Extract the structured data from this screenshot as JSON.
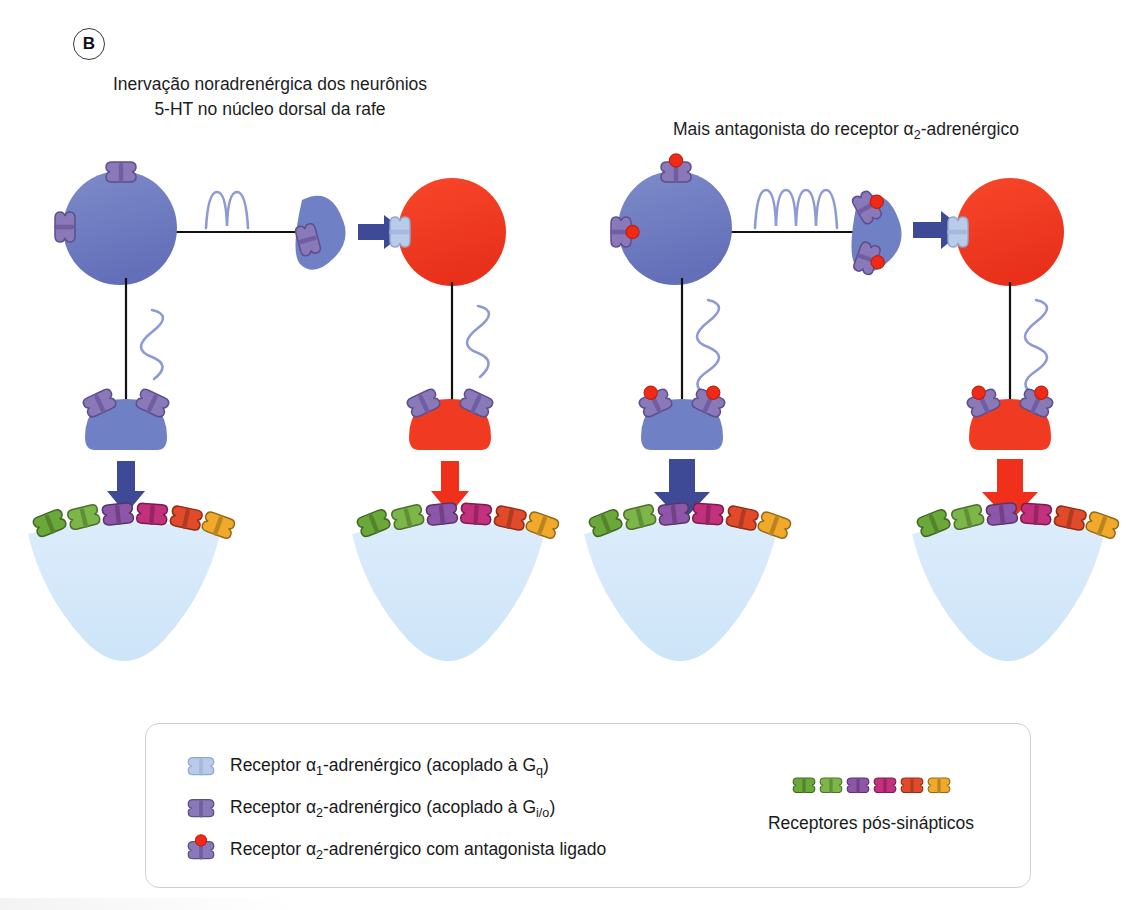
{
  "figure": {
    "panel_label": "B",
    "titles": {
      "left": "Inervação noradrenérgica dos neurônios\n5-HT no núcleo dorsal da rafe",
      "right_pre": "Mais antagonista do receptor ",
      "right_alpha": "α",
      "right_sub": "2",
      "right_post": "-adrenérgico"
    }
  },
  "legend": {
    "items": [
      {
        "icon": "alpha1-receptor-icon",
        "pre": "Receptor ",
        "alpha": "α",
        "sub": "1",
        "post": "-adrenérgico (acoplado à G",
        "gsub": "q",
        "tail": ")"
      },
      {
        "icon": "alpha2-receptor-icon",
        "pre": "Receptor ",
        "alpha": "α",
        "sub": "2",
        "post": "-adrenérgico (acoplado à G",
        "gsub": "i/o",
        "tail": ")"
      },
      {
        "icon": "alpha2-receptor-antagonist-icon",
        "pre": "Receptor ",
        "alpha": "α",
        "sub": "2",
        "post": "-adrenérgico com antagonista ligado",
        "gsub": "",
        "tail": ""
      }
    ],
    "postsynaptic_label": "Receptores pós-sinápticos",
    "postsynaptic_colors": [
      "#6aa83a",
      "#7cb648",
      "#8e56a8",
      "#c2307e",
      "#e24b2a",
      "#f0a92a"
    ]
  },
  "colors": {
    "neuron_blue": "#6f80c4",
    "neuron_blue_dark": "#4a559c",
    "neuron_red": "#f03b22",
    "postsynaptic_cell": "#d6e9f9",
    "arrow_blue": "#3f4a96",
    "arrow_red": "#f0301a",
    "axon_line": "#111111",
    "wave_blue": "#8d9ad4",
    "alpha1_light": "#b9cbe8",
    "alpha2_purple": "#8a79b8",
    "antagonist_red": "#ef2b18",
    "legend_border": "#d0d0d0"
  },
  "columns": [
    {
      "id": "col-1",
      "soma_color": "neuron_blue",
      "soma_receptors": [
        "alpha2",
        "alpha2"
      ],
      "axon_wave_cycles": 2,
      "terminal_receptors": [
        "alpha2"
      ],
      "transition_arrow": "blue",
      "target_soma_color": "neuron_red",
      "target_soma_receptors": [
        "alpha1"
      ],
      "bouton_color": "neuron_blue",
      "bouton_receptors": [
        "alpha2",
        "alpha2"
      ],
      "release_arrow": "blue",
      "release_arrow_size": "small"
    },
    {
      "id": "col-2",
      "bouton_color": "neuron_red",
      "bouton_receptors": [
        "alpha2",
        "alpha2"
      ],
      "release_arrow": "red",
      "release_arrow_size": "small"
    },
    {
      "id": "col-3",
      "soma_color": "neuron_blue",
      "soma_receptors": [
        "alpha2-antagonist",
        "alpha2-antagonist"
      ],
      "axon_wave_cycles": 4,
      "terminal_receptors": [
        "alpha2-antagonist",
        "alpha2-antagonist"
      ],
      "transition_arrow": "blue",
      "target_soma_color": "neuron_red",
      "target_soma_receptors": [
        "alpha1"
      ],
      "bouton_color": "neuron_blue",
      "bouton_receptors": [
        "alpha2-antagonist",
        "alpha2-antagonist"
      ],
      "release_arrow": "blue",
      "release_arrow_size": "large"
    },
    {
      "id": "col-4",
      "bouton_color": "neuron_red",
      "bouton_receptors": [
        "alpha2-antagonist",
        "alpha2-antagonist"
      ],
      "release_arrow": "red",
      "release_arrow_size": "large"
    }
  ]
}
